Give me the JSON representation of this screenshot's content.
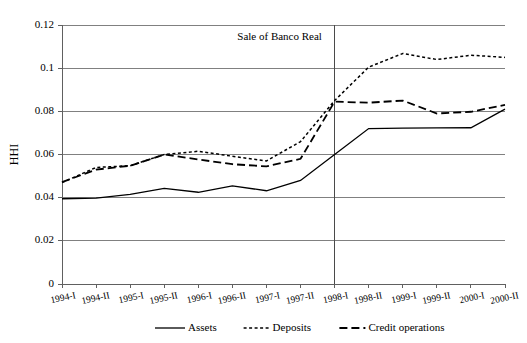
{
  "chart_data": {
    "type": "line",
    "title": "",
    "xlabel": "",
    "ylabel": "HHI",
    "ylim": [
      0,
      0.12
    ],
    "ytick_values": [
      0,
      0.02,
      0.04,
      0.06,
      0.08,
      0.1,
      0.12
    ],
    "ytick_labels": [
      "0",
      "0.02",
      "0.04",
      "0.06",
      "0.08",
      "0.1",
      "0.12"
    ],
    "grid": "horizontal",
    "legend_position": "bottom",
    "categories": [
      "1994-I",
      "1994-II",
      "1995-I",
      "1995-II",
      "1996-I",
      "1996-II",
      "1997-I",
      "1997-II",
      "1998-I",
      "1998-II",
      "1999-I",
      "1999-II",
      "2000-I",
      "2000-II"
    ],
    "series": [
      {
        "name": "Assets",
        "style": "solid",
        "values": [
          0.0395,
          0.0398,
          0.0415,
          0.0443,
          0.0425,
          0.0455,
          0.0432,
          0.048,
          0.06,
          0.072,
          0.0722,
          0.0723,
          0.0724,
          0.081
        ]
      },
      {
        "name": "Deposits",
        "style": "dotted",
        "values": [
          0.047,
          0.054,
          0.0548,
          0.06,
          0.0615,
          0.0592,
          0.057,
          0.066,
          0.085,
          0.1005,
          0.1068,
          0.104,
          0.106,
          0.105
        ]
      },
      {
        "name": "Credit operations",
        "style": "dashed",
        "values": [
          0.0472,
          0.053,
          0.0548,
          0.06,
          0.0577,
          0.0555,
          0.0545,
          0.058,
          0.0845,
          0.084,
          0.085,
          0.079,
          0.0798,
          0.083
        ]
      }
    ],
    "annotations": [
      {
        "text": "Sale of Banco Real",
        "at_category": "1998-I",
        "marker": "vertical-line"
      }
    ]
  },
  "legend": {
    "items": [
      {
        "label": "Assets",
        "style": "solid"
      },
      {
        "label": "Deposits",
        "style": "dotted"
      },
      {
        "label": "Credit operations",
        "style": "dashed"
      }
    ]
  }
}
